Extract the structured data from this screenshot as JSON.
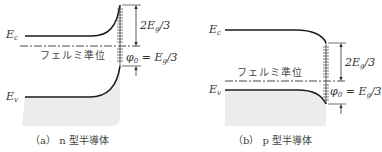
{
  "panel_a": {
    "ec_label": "E",
    "ec_sub": "c",
    "ev_label": "E",
    "ev_sub": "v",
    "fermi_label": "フェルミ準位",
    "gap_upper_label": "2E",
    "gap_upper_sub": "g",
    "gap_upper_tail": "/3",
    "phi_label": "φ",
    "phi_sub": "0",
    "phi_eq": " = E",
    "phi_eq_sub": "g",
    "phi_eq_tail": "/3",
    "caption_prefix": "（a）",
    "caption_text": "n 型半導体"
  },
  "panel_b": {
    "ec_label": "E",
    "ec_sub": "c",
    "ev_label": "E",
    "ev_sub": "v",
    "fermi_label": "フェルミ準位",
    "gap_upper_label": "2E",
    "gap_upper_sub": "g",
    "gap_upper_tail": "/3",
    "phi_label": "φ",
    "phi_sub": "0",
    "phi_eq": " = E",
    "phi_eq_sub": "g",
    "phi_eq_tail": "/3",
    "caption_prefix": "（b）",
    "caption_text": "p 型半導体"
  },
  "colors": {
    "line": "#1a1a1a",
    "shade": "#ececec",
    "dash": "#333333"
  }
}
